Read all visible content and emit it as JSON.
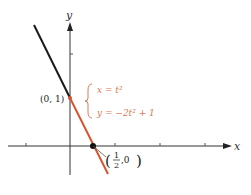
{
  "figure": {
    "axes": {
      "x_label": "x",
      "y_label": "y",
      "x_ticks": [
        -1,
        1,
        2,
        3
      ],
      "y_ticks": [
        2
      ]
    },
    "points": {
      "start": {
        "label": "(0, 1)",
        "x": 0,
        "y": 1
      },
      "intercept": {
        "label_num": "1",
        "label_den": "2",
        "label_rest": ",0",
        "x": 0.5,
        "y": 0
      }
    },
    "equations": {
      "line1": "x = t²",
      "line2": "y = −2t² + 1"
    },
    "colors": {
      "curve": "#d4532e",
      "equation_text": "#d97a55",
      "line_black": "#1a1a1a",
      "axis": "#333333"
    }
  }
}
